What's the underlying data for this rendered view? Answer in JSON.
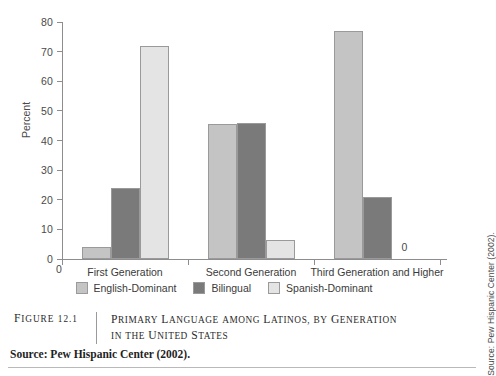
{
  "chart_data": {
    "type": "bar",
    "title": "",
    "xlabel": "",
    "ylabel": "Percent",
    "ylim": [
      0,
      80
    ],
    "yticks": [
      0,
      10,
      20,
      30,
      40,
      50,
      60,
      70,
      80
    ],
    "grid": false,
    "legend_position": "bottom-center",
    "origin_label": "0",
    "categories": [
      "First Generation",
      "Second Generation",
      "Third Generation and Higher"
    ],
    "series": [
      {
        "name": "English-Dominant",
        "color": "#c4c4c4",
        "values": [
          4,
          45.5,
          77
        ]
      },
      {
        "name": "Bilingual",
        "color": "#7a7a7a",
        "values": [
          24,
          46,
          21
        ]
      },
      {
        "name": "Spanish-Dominant",
        "color": "#e4e4e4",
        "values": [
          72,
          6.5,
          0
        ]
      }
    ],
    "annotations": [
      {
        "text": "0",
        "series": "Spanish-Dominant",
        "category": "Third Generation and Higher"
      }
    ]
  },
  "caption": {
    "figure_number": "Figure 12.1",
    "title": "Primary Language among Latinos, by Generation in the United States"
  },
  "source": {
    "footer": "Source: Pew Hispanic Center (2002).",
    "side_note": "Source: Pew Hispanic Center (2002)."
  }
}
